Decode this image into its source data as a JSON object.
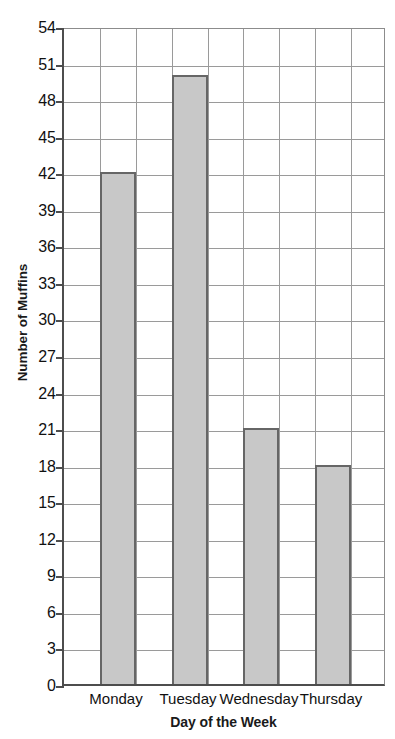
{
  "chart_data": {
    "type": "bar",
    "title": "",
    "subtitle": "",
    "categories": [
      "Monday",
      "Tuesday",
      "Wednesday",
      "Thursday"
    ],
    "values": [
      42,
      50,
      21,
      18
    ],
    "xlabel": "Day of the Week",
    "ylabel": "Number of Muffins",
    "ylim": [
      0,
      54
    ],
    "ytick_step": 3,
    "yticks": [
      0,
      3,
      6,
      9,
      12,
      15,
      18,
      21,
      24,
      27,
      30,
      33,
      36,
      39,
      42,
      45,
      48,
      51,
      54
    ],
    "ytick_labels": [
      "0",
      "3",
      "6",
      "9",
      "12",
      "15",
      "18",
      "21",
      "24",
      "27",
      "30",
      "33",
      "36",
      "39",
      "42",
      "45",
      "48",
      "51",
      "54"
    ],
    "grid": true,
    "grid_axes": "both",
    "vertical_grid_columns": 9,
    "legend": false,
    "legend_position": "none",
    "annotations": [],
    "series": [
      {
        "name": "Number of Muffins",
        "values": [
          42,
          50,
          21,
          18
        ]
      }
    ]
  },
  "style": {
    "bar_fill": "#c8c8c8",
    "bar_border": "#666666",
    "gridline_color": "#9a9a9a",
    "axis_color": "#4d4d4d",
    "text_color": "#111111",
    "title_color": "#1a1a1a",
    "background": "#ffffff"
  }
}
